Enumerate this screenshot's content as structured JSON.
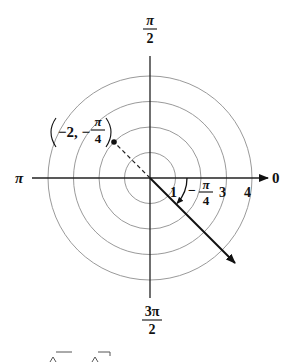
{
  "diagram": {
    "type": "polar-coordinate-plot",
    "center": {
      "x": 150,
      "y": 178
    },
    "ring_radii_px": [
      25.5,
      51,
      76.5,
      102
    ],
    "ring_labels": [
      "1",
      "3",
      "4"
    ],
    "ring_label_hidden_note": "ring 2 label replaced by angle label",
    "axis_labels": {
      "top": {
        "numerator": "π",
        "denominator": "2"
      },
      "bottom": {
        "numerator": "3π",
        "denominator": "2"
      },
      "left": "π",
      "right": "0"
    },
    "point": {
      "r": "−2",
      "theta_sign": "−",
      "theta_numerator": "π",
      "theta_denominator": "4",
      "label_prefix": "−2, −",
      "display": "(−2, −π/4)"
    },
    "angle_label": {
      "sign": "−",
      "numerator": "π",
      "denominator": "4"
    },
    "colors": {
      "rings": "#9a9a9a",
      "axes": "#222222",
      "ink": "#111111",
      "background": "#ffffff"
    }
  },
  "footer": {
    "cut_off_text_note": "partially visible square-root expressions"
  }
}
